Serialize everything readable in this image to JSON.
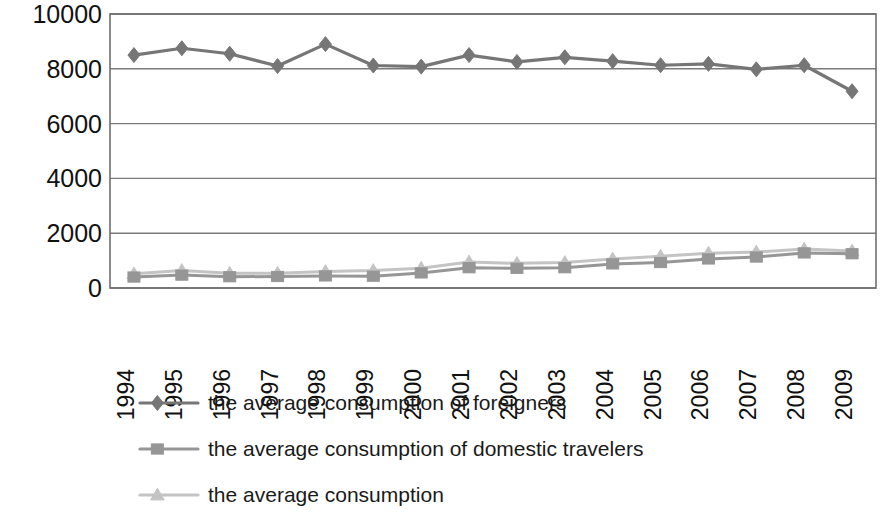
{
  "chart_data": {
    "type": "line",
    "title": "",
    "subtitle": "",
    "xlabel": "",
    "ylabel": "",
    "ylim": [
      0,
      10000
    ],
    "yticks": [
      0,
      2000,
      4000,
      6000,
      8000,
      10000
    ],
    "ytick_labels": [
      "0",
      "2000",
      "4000",
      "6000",
      "8000",
      "10000"
    ],
    "grid": true,
    "grid_axis": "y",
    "legend_position": "bottom-left",
    "categories": [
      "1994",
      "1995",
      "1996",
      "1997",
      "1998",
      "1999",
      "2000",
      "2001",
      "2002",
      "2003",
      "2004",
      "2005",
      "2006",
      "2007",
      "2008",
      "2009"
    ],
    "x_tick_rotation": -90,
    "series": [
      {
        "name": "the average consumption of foreigners",
        "marker": "diamond",
        "color": "#767676",
        "values": [
          8500,
          8750,
          8550,
          8100,
          8900,
          8120,
          8080,
          8500,
          8250,
          8420,
          8280,
          8130,
          8180,
          7980,
          8130,
          7180
        ]
      },
      {
        "name": "the average consumption of domestic travelers",
        "marker": "square",
        "color": "#969696",
        "values": [
          400,
          470,
          410,
          420,
          440,
          430,
          550,
          740,
          720,
          740,
          880,
          930,
          1060,
          1130,
          1280,
          1250
        ]
      },
      {
        "name": "the average consumption",
        "marker": "triangle",
        "color": "#c4c4c4",
        "values": [
          520,
          640,
          540,
          540,
          600,
          640,
          720,
          950,
          900,
          930,
          1060,
          1160,
          1270,
          1310,
          1420,
          1350
        ]
      }
    ]
  },
  "legend": {
    "items": [
      {
        "label": "the average consumption of foreigners",
        "marker": "diamond-marker",
        "color": "#767676"
      },
      {
        "label": "the average consumption of domestic travelers",
        "marker": "square-marker",
        "color": "#969696"
      },
      {
        "label": "the average consumption",
        "marker": "triangle-marker",
        "color": "#c4c4c4"
      }
    ]
  }
}
